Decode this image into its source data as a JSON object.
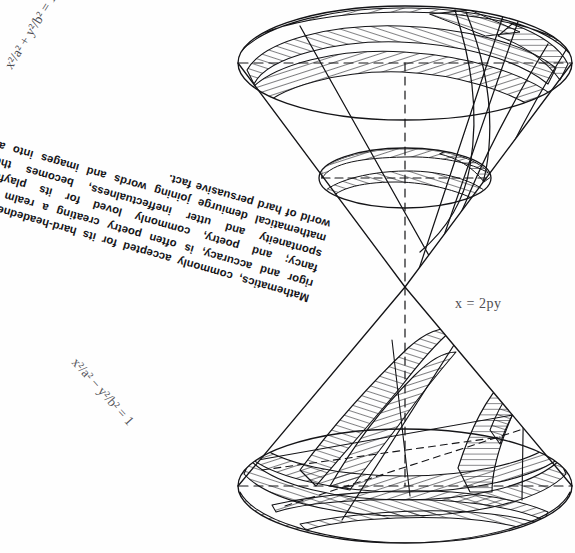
{
  "page": {
    "background_color": "#ffffff",
    "ink_color": "#16161a"
  },
  "prose": {
    "name": "mathematics-poetry-paragraph",
    "lines": [
      "Mathematics, commonly accepted for its hard-",
      "headedness, rigor and accuracy, is often poetry",
      "creating a realm of fancy; and poetry, commonly",
      "loved for its playful spontaneity and utter ineffectu-",
      "alness, becomes the mathematical demiurge joining",
      "words and images into a world of hard persuasive",
      "fact."
    ],
    "full_text": "Mathematics, commonly accepted for its hard-headedness, rigor and accuracy, is often poetry creating a realm of fancy; and poetry, commonly loved for its playful spontaneity and utter ineffectualness, becomes the mathematical demiurge joining words and images into a world of hard persuasive fact.",
    "rotation_degrees": 196
  },
  "formulas": {
    "ellipse": {
      "label": "x²/a² + y²/b² = 1",
      "plain": "x^2/a^2 + y^2/b^2 = 1",
      "conic": "ellipse",
      "rotation_degrees": -58
    },
    "hyperbola": {
      "label": "x²/a² − y²/b² = 1",
      "plain": "x^2/a^2 - y^2/b^2 = 1",
      "conic": "hyperbola",
      "rotation_degrees": 48
    },
    "parabola": {
      "label": "x = 2py",
      "plain": "x = 2py",
      "conic": "parabola",
      "rotation_degrees": 0
    }
  },
  "figure": {
    "name": "double-cone-conic-sections",
    "apex": {
      "x": 405,
      "y": 287
    },
    "upper_nappe": {
      "base_ellipse": {
        "cx": 405,
        "cy": 63,
        "rx": 168,
        "ry": 58
      },
      "inner_ellipse": {
        "cx": 405,
        "cy": 178,
        "rx": 86,
        "ry": 30
      }
    },
    "lower_nappe": {
      "base_ellipse": {
        "cx": 405,
        "cy": 486,
        "rx": 168,
        "ry": 58
      }
    },
    "axis": {
      "x": 405,
      "top": 63,
      "bottom": 486,
      "style": "dashed"
    }
  }
}
